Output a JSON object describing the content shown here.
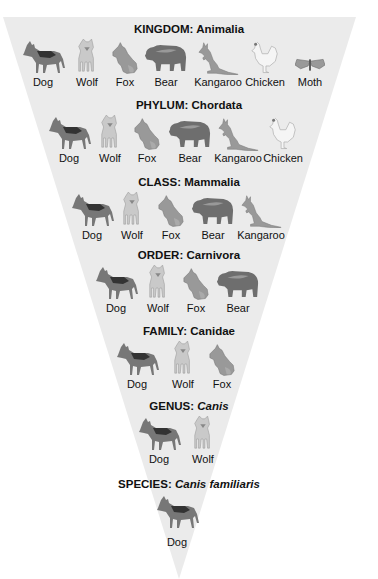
{
  "diagram": {
    "type": "taxonomy-inverted-pyramid",
    "background_color": "#ffffff",
    "pyramid_color": "#ebebeb",
    "levels": [
      {
        "rank": "KINGDOM:",
        "name": "Animalia",
        "italic": false,
        "animals": [
          "Dog",
          "Wolf",
          "Fox",
          "Bear",
          "Kangaroo",
          "Chicken",
          "Moth"
        ]
      },
      {
        "rank": "PHYLUM:",
        "name": "Chordata",
        "italic": false,
        "animals": [
          "Dog",
          "Wolf",
          "Fox",
          "Bear",
          "Kangaroo",
          "Chicken"
        ]
      },
      {
        "rank": "CLASS:",
        "name": "Mammalia",
        "italic": false,
        "animals": [
          "Dog",
          "Wolf",
          "Fox",
          "Bear",
          "Kangaroo"
        ]
      },
      {
        "rank": "ORDER:",
        "name": "Carnivora",
        "italic": false,
        "animals": [
          "Dog",
          "Wolf",
          "Fox",
          "Bear"
        ]
      },
      {
        "rank": "FAMILY:",
        "name": "Canidae",
        "italic": false,
        "animals": [
          "Dog",
          "Wolf",
          "Fox"
        ]
      },
      {
        "rank": "GENUS:",
        "name": "Canis",
        "italic": true,
        "animals": [
          "Dog",
          "Wolf"
        ]
      },
      {
        "rank": "SPECIES:",
        "name": "Canis familiaris",
        "italic": true,
        "animals": [
          "Dog"
        ]
      }
    ]
  }
}
